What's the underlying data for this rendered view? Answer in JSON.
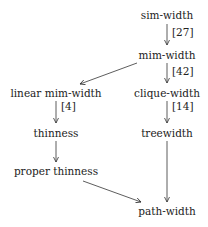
{
  "nodes": [
    {
      "id": "sim-width",
      "label": "sim-width"
    },
    {
      "id": "mim-width",
      "label": "mim-width"
    },
    {
      "id": "linear-mim-width",
      "label": "linear mim-width"
    },
    {
      "id": "clique-width",
      "label": "clique-width"
    },
    {
      "id": "thinness",
      "label": "thinness"
    },
    {
      "id": "treewidth",
      "label": "treewidth"
    },
    {
      "id": "proper-thinness",
      "label": "proper thinness"
    },
    {
      "id": "path-width",
      "label": "path-width"
    }
  ],
  "edges": [
    {
      "from": "sim-width",
      "to": "mim-width",
      "label": "[27]"
    },
    {
      "from": "mim-width",
      "to": "clique-width",
      "label": "[42]"
    },
    {
      "from": "mim-width",
      "to": "linear-mim-width",
      "label": ""
    },
    {
      "from": "linear-mim-width",
      "to": "thinness",
      "label": "[4]"
    },
    {
      "from": "clique-width",
      "to": "treewidth",
      "label": "[14]"
    },
    {
      "from": "thinness",
      "to": "proper-thinness",
      "label": ""
    },
    {
      "from": "treewidth",
      "to": "path-width",
      "label": ""
    },
    {
      "from": "proper-thinness",
      "to": "path-width",
      "label": ""
    }
  ]
}
